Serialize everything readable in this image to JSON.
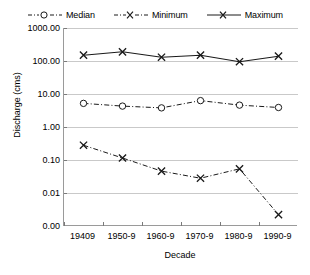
{
  "chart_data": {
    "type": "line",
    "title": "",
    "xlabel": "Decade",
    "ylabel": "Discharge (cms)",
    "categories": [
      "19409",
      "1950-9",
      "1960-9",
      "1970-9",
      "1980-9",
      "1990-9"
    ],
    "yscale": "log",
    "ylim": [
      0.001,
      1000
    ],
    "ytick_labels": [
      "1000.00",
      "100.00",
      "10.00",
      "1.00",
      "0.10",
      "0.01",
      "0.00"
    ],
    "ytick_values": [
      1000,
      100,
      10,
      1,
      0.1,
      0.01,
      0.001
    ],
    "grid": true,
    "legend_position": "top",
    "series": [
      {
        "name": "Median",
        "marker": "open-circle",
        "linestyle": "dash-dot",
        "color": "#1a1a1a",
        "values": [
          5.2,
          4.3,
          3.8,
          6.3,
          4.6,
          3.9
        ]
      },
      {
        "name": "Minimum",
        "marker": "x",
        "linestyle": "dash-dot",
        "color": "#1a1a1a",
        "values": [
          0.28,
          0.115,
          0.046,
          0.028,
          0.054,
          0.0022
        ]
      },
      {
        "name": "Maximum",
        "marker": "x",
        "linestyle": "solid",
        "color": "#1a1a1a",
        "values": [
          150,
          190,
          130,
          150,
          95,
          140
        ]
      }
    ]
  },
  "legend": {
    "items": [
      {
        "label": "Median"
      },
      {
        "label": "Minimum"
      },
      {
        "label": "Maximum"
      }
    ]
  },
  "axes": {
    "y_title": "Discharge (cms)",
    "x_title": "Decade"
  }
}
